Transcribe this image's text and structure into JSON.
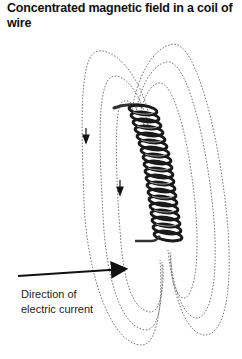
{
  "title": "Concentrated magnetic field in a coil of wire",
  "label": {
    "line1": "Direction of",
    "line2": "electric current"
  },
  "diagram": {
    "turns": 20,
    "field_lines_left": 3,
    "field_lines_right": 3,
    "field_arrows": [
      "down",
      "down"
    ],
    "current_arrow": "points right toward coil lead",
    "colors": {
      "wire": "#1a1a1a",
      "field_line": "#666666",
      "text": "#222222"
    }
  }
}
